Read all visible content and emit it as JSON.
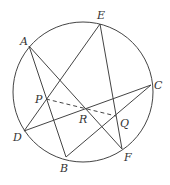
{
  "diagram": {
    "type": "geometry",
    "stroke_color": "#444444",
    "circle": {
      "cx": 83,
      "cy": 92,
      "r": 70
    },
    "points": {
      "A": {
        "x": 29,
        "y": 46,
        "label": "A",
        "lx": 20,
        "ly": 45
      },
      "E": {
        "x": 100,
        "y": 24,
        "label": "E",
        "lx": 97,
        "ly": 19
      },
      "C": {
        "x": 151,
        "y": 85,
        "label": "C",
        "lx": 154,
        "ly": 89
      },
      "D": {
        "x": 24,
        "y": 131,
        "label": "D",
        "lx": 13,
        "ly": 141
      },
      "B": {
        "x": 66,
        "y": 157,
        "label": "B",
        "lx": 60,
        "ly": 172
      },
      "F": {
        "x": 122,
        "y": 149,
        "label": "F",
        "lx": 124,
        "ly": 161
      },
      "P": {
        "x": 46,
        "y": 99,
        "label": "P",
        "lx": 35,
        "ly": 103
      },
      "R": {
        "x": 86,
        "y": 108,
        "label": "R",
        "lx": 79,
        "ly": 123
      },
      "Q": {
        "x": 116,
        "y": 116,
        "label": "Q",
        "lx": 120,
        "ly": 127
      }
    },
    "segments": [
      {
        "from": "A",
        "to": "B",
        "style": "solid"
      },
      {
        "from": "A",
        "to": "F",
        "style": "solid"
      },
      {
        "from": "E",
        "to": "D",
        "style": "solid"
      },
      {
        "from": "E",
        "to": "F",
        "style": "solid"
      },
      {
        "from": "D",
        "to": "C",
        "style": "solid"
      },
      {
        "from": "B",
        "to": "C",
        "style": "solid"
      },
      {
        "from": "P",
        "to": "Q",
        "style": "dashed"
      }
    ]
  }
}
